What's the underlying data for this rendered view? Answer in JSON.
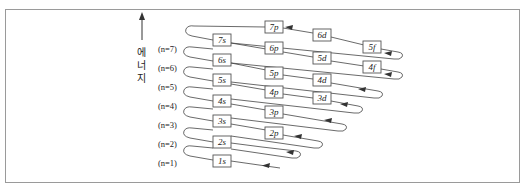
{
  "figure": {
    "type": "aufbau-filling-order-diagram",
    "axis_label_chars": [
      "에",
      "너",
      "지"
    ],
    "axis_label": "에너지",
    "n_labels": [
      {
        "text": "(n=7)",
        "y": 50
      },
      {
        "text": "(n=6)",
        "y": 69
      },
      {
        "text": "(n=5)",
        "y": 88
      },
      {
        "text": "(n=4)",
        "y": 107
      },
      {
        "text": "(n=3)",
        "y": 126
      },
      {
        "text": "(n=2)",
        "y": 145
      },
      {
        "text": "(n=1)",
        "y": 164
      }
    ],
    "orbitals": [
      {
        "label": "1s",
        "x": 222,
        "y": 161
      },
      {
        "label": "2s",
        "x": 222,
        "y": 142
      },
      {
        "label": "2p",
        "x": 274,
        "y": 133
      },
      {
        "label": "3s",
        "x": 222,
        "y": 121
      },
      {
        "label": "3p",
        "x": 274,
        "y": 112
      },
      {
        "label": "3d",
        "x": 322,
        "y": 98
      },
      {
        "label": "4s",
        "x": 222,
        "y": 101
      },
      {
        "label": "4p",
        "x": 274,
        "y": 92
      },
      {
        "label": "4d",
        "x": 322,
        "y": 80
      },
      {
        "label": "4f",
        "x": 372,
        "y": 67
      },
      {
        "label": "5s",
        "x": 222,
        "y": 80
      },
      {
        "label": "5p",
        "x": 274,
        "y": 73
      },
      {
        "label": "5d",
        "x": 322,
        "y": 58
      },
      {
        "label": "5f",
        "x": 372,
        "y": 47
      },
      {
        "label": "6s",
        "x": 222,
        "y": 60
      },
      {
        "label": "6p",
        "x": 274,
        "y": 48
      },
      {
        "label": "6d",
        "x": 322,
        "y": 35
      },
      {
        "label": "7s",
        "x": 222,
        "y": 40
      },
      {
        "label": "7p",
        "x": 274,
        "y": 27
      }
    ],
    "filling_order": [
      "1s",
      "2s",
      "2p",
      "3s",
      "3p",
      "4s",
      "3d",
      "4p",
      "5s",
      "4d",
      "5p",
      "6s",
      "4f",
      "5d",
      "6p",
      "7s",
      "5f",
      "6d",
      "7p"
    ]
  }
}
